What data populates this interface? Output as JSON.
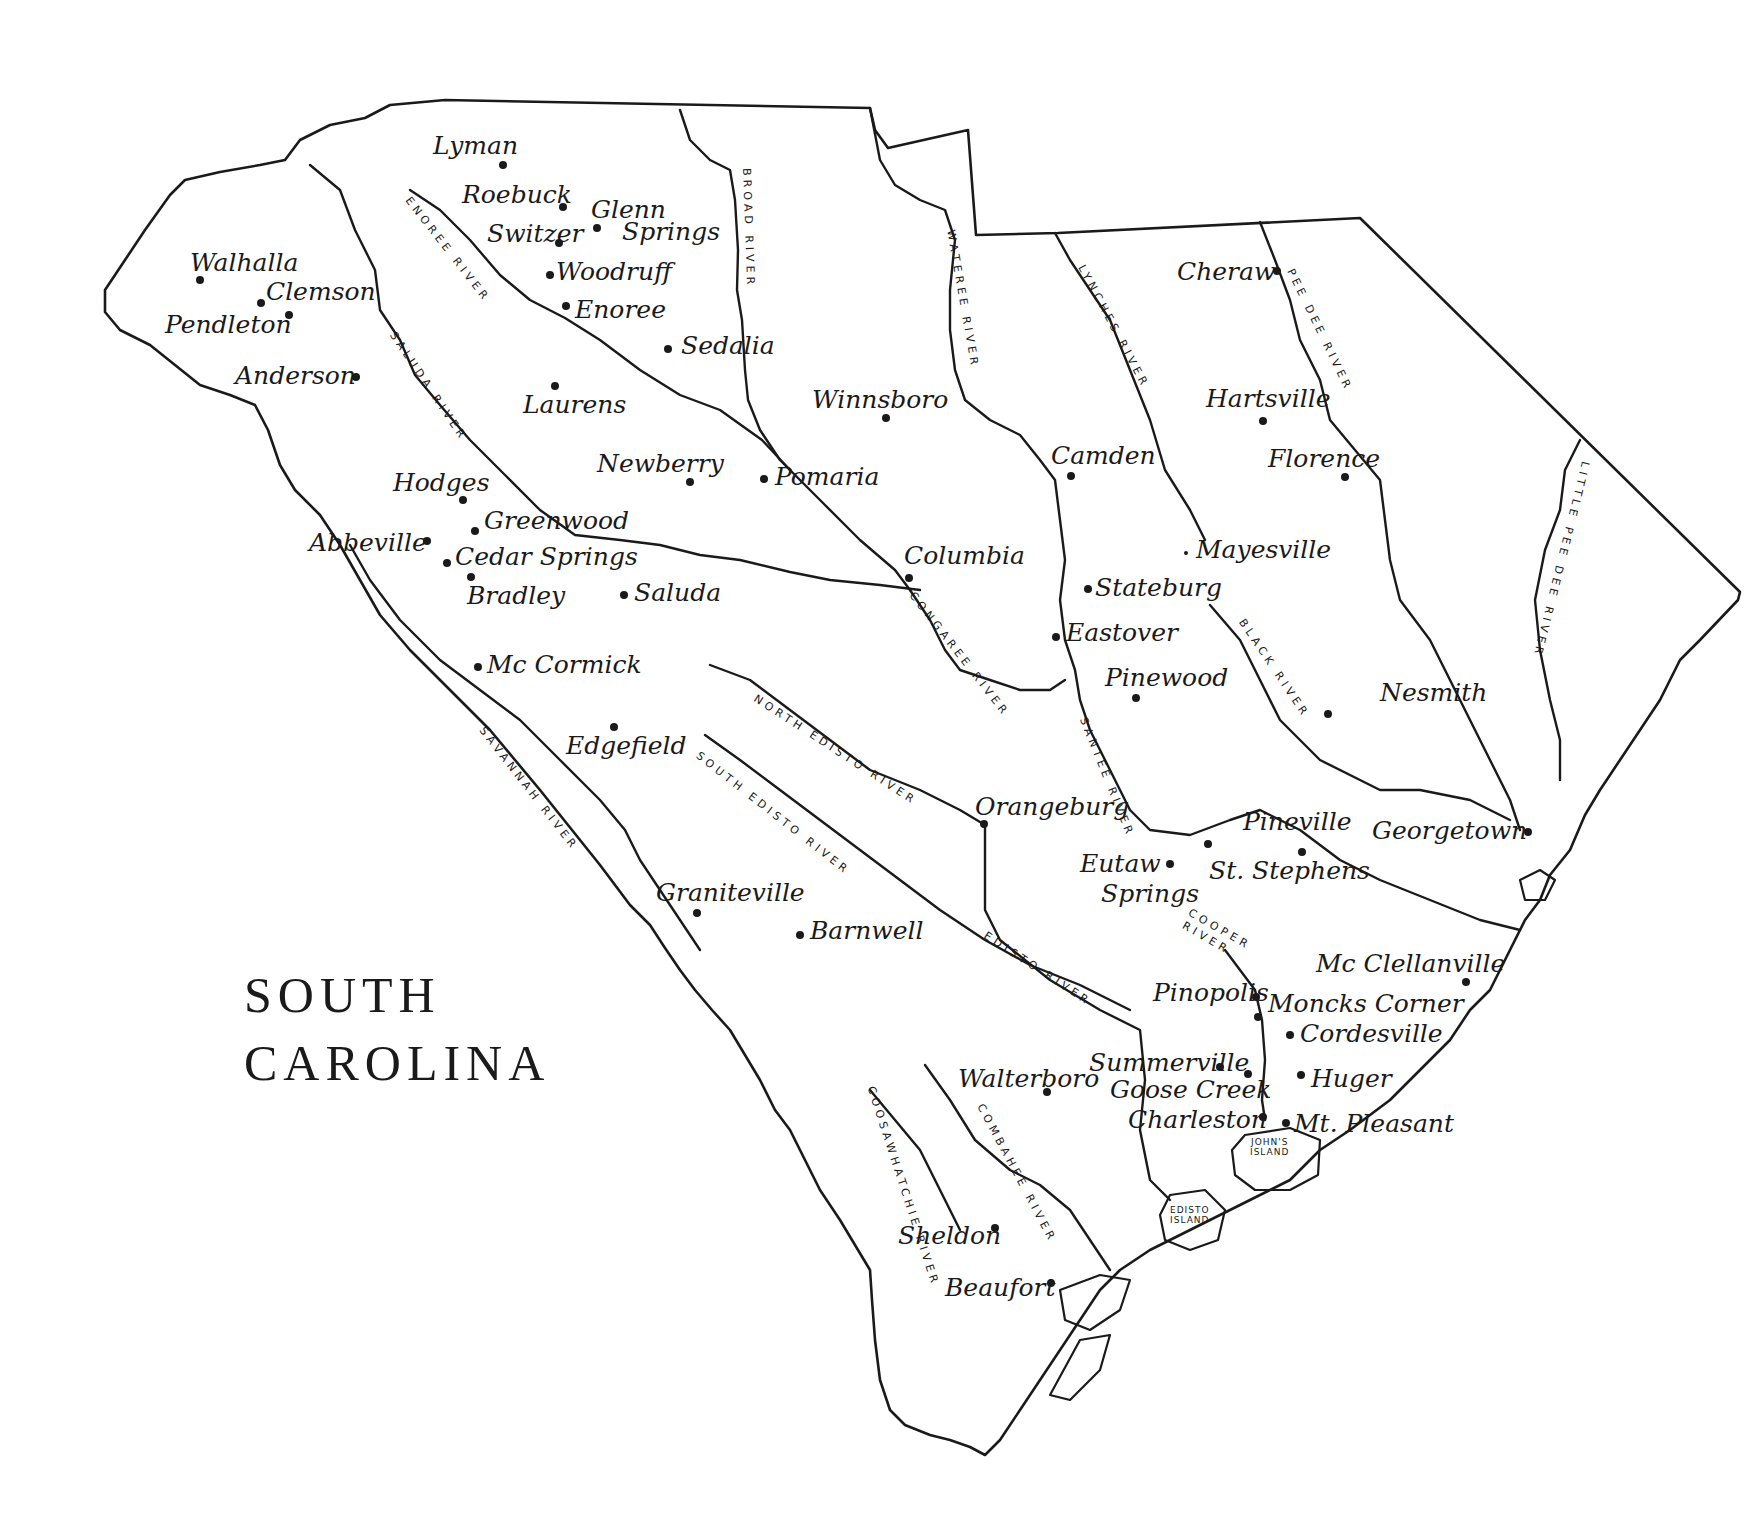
{
  "map": {
    "title_line1": "SOUTH",
    "title_line2": "CAROLINA",
    "cities": [
      {
        "name": "Lyman",
        "label": "Lyman",
        "dot": [
          503,
          165
        ],
        "lx": 433,
        "ly": 133
      },
      {
        "name": "Roebuck",
        "label": "Roebuck",
        "dot": [
          563,
          207
        ],
        "lx": 462,
        "ly": 182
      },
      {
        "name": "Switzer",
        "label": "Switzer",
        "dot": [
          559,
          243
        ],
        "lx": 487,
        "ly": 221
      },
      {
        "name": "Glenn Springs",
        "label": "Glenn",
        "label2": "Springs",
        "dot": [
          597,
          228
        ],
        "lx": 591,
        "ly": 197,
        "lx2": 622,
        "ly2": 219
      },
      {
        "name": "Woodruff",
        "label": "Woodruff",
        "dot": [
          550,
          275
        ],
        "lx": 556,
        "ly": 259
      },
      {
        "name": "Enoree",
        "label": "Enoree",
        "dot": [
          566,
          306
        ],
        "lx": 575,
        "ly": 297
      },
      {
        "name": "Walhalla",
        "label": "Walhalla",
        "dot": [
          200,
          280
        ],
        "lx": 190,
        "ly": 250
      },
      {
        "name": "Clemson",
        "label": "Clemson",
        "dot": [
          261,
          303
        ],
        "lx": 266,
        "ly": 279
      },
      {
        "name": "Pendleton",
        "label": "Pendleton",
        "dot": [
          289,
          315
        ],
        "lx": 165,
        "ly": 312
      },
      {
        "name": "Anderson",
        "label": "Anderson",
        "dot": [
          356,
          377
        ],
        "lx": 235,
        "ly": 363
      },
      {
        "name": "Sedalia",
        "label": "Sedalia",
        "dot": [
          668,
          349
        ],
        "lx": 681,
        "ly": 333
      },
      {
        "name": "Laurens",
        "label": "Laurens",
        "dot": [
          555,
          386
        ],
        "lx": 523,
        "ly": 392
      },
      {
        "name": "Winnsboro",
        "label": "Winnsboro",
        "dot": [
          886,
          418
        ],
        "lx": 812,
        "ly": 387
      },
      {
        "name": "Newberry",
        "label": "Newberry",
        "dot": [
          690,
          482
        ],
        "lx": 597,
        "ly": 451
      },
      {
        "name": "Pomaria",
        "label": "Pomaria",
        "dot": [
          764,
          479
        ],
        "lx": 775,
        "ly": 464
      },
      {
        "name": "Hodges",
        "label": "Hodges",
        "dot": [
          463,
          500
        ],
        "lx": 393,
        "ly": 470
      },
      {
        "name": "Greenwood",
        "label": "Greenwood",
        "dot": [
          475,
          531
        ],
        "lx": 484,
        "ly": 508
      },
      {
        "name": "Abbeville",
        "label": "Abbeville",
        "dot": [
          427,
          541
        ],
        "lx": 309,
        "ly": 530
      },
      {
        "name": "Cedar Springs",
        "label": "Cedar Springs",
        "dot": [
          447,
          563
        ],
        "lx": 455,
        "ly": 544
      },
      {
        "name": "Bradley",
        "label": "Bradley",
        "dot": [
          471,
          577
        ],
        "lx": 467,
        "ly": 583
      },
      {
        "name": "Saluda",
        "label": "Saluda",
        "dot": [
          624,
          595
        ],
        "lx": 634,
        "ly": 580
      },
      {
        "name": "Mc Cormick",
        "label": "Mc Cormick",
        "dot": [
          478,
          667
        ],
        "lx": 487,
        "ly": 652
      },
      {
        "name": "Edgefield",
        "label": "Edgefield",
        "dot": [
          614,
          727
        ],
        "lx": 566,
        "ly": 733
      },
      {
        "name": "Camden",
        "label": "Camden",
        "dot": [
          1071,
          476
        ],
        "lx": 1051,
        "ly": 443
      },
      {
        "name": "Columbia",
        "label": "Columbia",
        "dot": [
          909,
          578
        ],
        "lx": 904,
        "ly": 543
      },
      {
        "name": "Stateburg",
        "label": "Stateburg",
        "dot": [
          1088,
          589
        ],
        "lx": 1095,
        "ly": 575
      },
      {
        "name": "Eastover",
        "label": "Eastover",
        "dot": [
          1056,
          637
        ],
        "lx": 1066,
        "ly": 620
      },
      {
        "name": "Pinewood",
        "label": "Pinewood",
        "dot": [
          1136,
          698
        ],
        "lx": 1105,
        "ly": 665
      },
      {
        "name": "Cheraw",
        "label": "Cheraw",
        "dot": [
          1277,
          271
        ],
        "lx": 1177,
        "ly": 259
      },
      {
        "name": "Hartsville",
        "label": "Hartsville",
        "dot": [
          1263,
          421
        ],
        "lx": 1206,
        "ly": 386
      },
      {
        "name": "Florence",
        "label": "Florence",
        "dot": [
          1345,
          477
        ],
        "lx": 1268,
        "ly": 446
      },
      {
        "name": "Mayesville",
        "label": "Mayesville",
        "dot": [
          1186,
          553
        ],
        "lx": 1196,
        "ly": 537,
        "small": true
      },
      {
        "name": "Nesmith",
        "label": "Nesmith",
        "dot": [
          1328,
          714
        ],
        "lx": 1380,
        "ly": 680
      },
      {
        "name": "Orangeburg",
        "label": "Orangeburg",
        "dot": [
          984,
          824
        ],
        "lx": 975,
        "ly": 794
      },
      {
        "name": "Pineville",
        "label": "Pineville",
        "dot": [
          1208,
          844
        ],
        "lx": 1243,
        "ly": 809
      },
      {
        "name": "Georgetown",
        "label": "Georgetown",
        "dot": [
          1528,
          832
        ],
        "lx": 1372,
        "ly": 818
      },
      {
        "name": "St. Stephens",
        "label": "St. Stephens",
        "dot": [
          1302,
          852
        ],
        "lx": 1209,
        "ly": 858
      },
      {
        "name": "Eutaw Springs",
        "label": "Eutaw",
        "label2": "Springs",
        "dot": [
          1170,
          864
        ],
        "lx": 1080,
        "ly": 851,
        "lx2": 1101,
        "ly2": 881
      },
      {
        "name": "Graniteville",
        "label": "Graniteville",
        "dot": [
          697,
          913
        ],
        "lx": 656,
        "ly": 880
      },
      {
        "name": "Barnwell",
        "label": "Barnwell",
        "dot": [
          800,
          935
        ],
        "lx": 810,
        "ly": 918
      },
      {
        "name": "Mc Clellanville",
        "label": "Mc Clellanville",
        "dot": [
          1466,
          982
        ],
        "lx": 1316,
        "ly": 951
      },
      {
        "name": "Pinopolis",
        "label": "Pinopolis",
        "dot": [
          1256,
          997
        ],
        "lx": 1153,
        "ly": 980
      },
      {
        "name": "Moncks Corner",
        "label": "Moncks Corner",
        "dot": [
          1258,
          1017
        ],
        "lx": 1268,
        "ly": 991
      },
      {
        "name": "Cordesville",
        "label": "Cordesville",
        "dot": [
          1290,
          1035
        ],
        "lx": 1300,
        "ly": 1021
      },
      {
        "name": "Summerville",
        "label": "Summerville",
        "dot": [
          1220,
          1067
        ],
        "lx": 1089,
        "ly": 1050
      },
      {
        "name": "Goose Creek",
        "label": "Goose Creek",
        "dot": [
          1248,
          1074
        ],
        "lx": 1110,
        "ly": 1077
      },
      {
        "name": "Walterboro",
        "label": "Walterboro",
        "dot": [
          1047,
          1092
        ],
        "lx": 958,
        "ly": 1066
      },
      {
        "name": "Huger",
        "label": "Huger",
        "dot": [
          1301,
          1075
        ],
        "lx": 1311,
        "ly": 1066
      },
      {
        "name": "Charleston",
        "label": "Charleston",
        "dot": [
          1263,
          1117
        ],
        "lx": 1128,
        "ly": 1107
      },
      {
        "name": "Mt. Pleasant",
        "label": "Mt. Pleasant",
        "dot": [
          1286,
          1123
        ],
        "lx": 1294,
        "ly": 1111
      },
      {
        "name": "Sheldon",
        "label": "Sheldon",
        "dot": [
          995,
          1228
        ],
        "lx": 898,
        "ly": 1223
      },
      {
        "name": "Beaufort",
        "label": "Beaufort",
        "dot": [
          1051,
          1283
        ],
        "lx": 945,
        "ly": 1275
      }
    ],
    "rivers": [
      {
        "name": "ENOREE RIVER",
        "x": 412,
        "y": 195,
        "rot": 52
      },
      {
        "name": "SALUDA RIVER",
        "x": 397,
        "y": 330,
        "rot": 56
      },
      {
        "name": "BROAD RIVER",
        "x": 752,
        "y": 168,
        "rot": 88
      },
      {
        "name": "WATEREE RIVER",
        "x": 956,
        "y": 229,
        "rot": 80
      },
      {
        "name": "LYNCHES RIVER",
        "x": 1086,
        "y": 263,
        "rot": 62
      },
      {
        "name": "PEE DEE RIVER",
        "x": 1295,
        "y": 267,
        "rot": 64
      },
      {
        "name": "LITTLE PEE DEE RIVER",
        "x": 1591,
        "y": 463,
        "rot": 104
      },
      {
        "name": "CONGAREE RIVER",
        "x": 916,
        "y": 590,
        "rot": 52
      },
      {
        "name": "BLACK RIVER",
        "x": 1246,
        "y": 617,
        "rot": 56
      },
      {
        "name": "NORTH EDISTO RIVER",
        "x": 758,
        "y": 693,
        "rot": 33
      },
      {
        "name": "SOUTH EDISTO RIVER",
        "x": 701,
        "y": 750,
        "rot": 38
      },
      {
        "name": "SANTEE RIVER",
        "x": 1088,
        "y": 716,
        "rot": 68
      },
      {
        "name": "SAVANNAH RIVER",
        "x": 486,
        "y": 725,
        "rot": 52
      },
      {
        "name": "EDISTO RIVER",
        "x": 988,
        "y": 930,
        "rot": 33
      },
      {
        "name": "COOPER",
        "x": 1192,
        "y": 907,
        "rot": 30
      },
      {
        "name": "RIVER",
        "x": 1186,
        "y": 920,
        "rot": 30
      },
      {
        "name": "COMBAHEE RIVER",
        "x": 985,
        "y": 1102,
        "rot": 62
      },
      {
        "name": "COOSAWHATCHIE RIVER",
        "x": 876,
        "y": 1085,
        "rot": 72
      }
    ],
    "islands": [
      {
        "name": "John's Island",
        "line1": "JOHN'S",
        "line2": "ISLAND",
        "x": 1250,
        "y": 1138
      },
      {
        "name": "Edisto Island",
        "line1": "EDISTO",
        "line2": "ISLAND",
        "x": 1170,
        "y": 1206
      }
    ],
    "colors": {
      "ink": "#1a1a1a",
      "paper": "#ffffff"
    }
  }
}
